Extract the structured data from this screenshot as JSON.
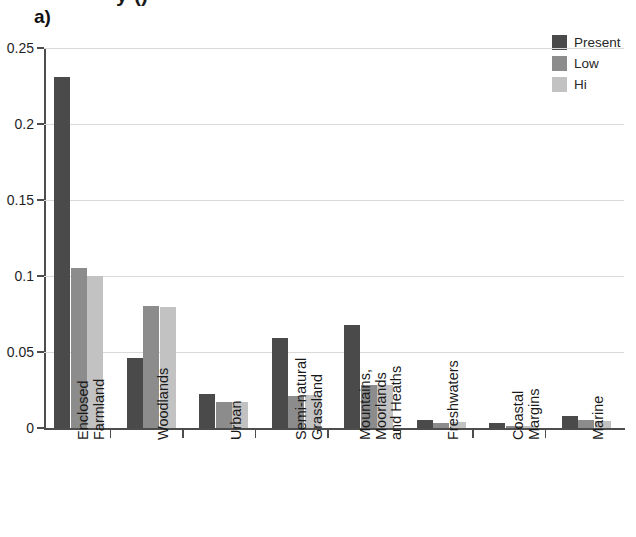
{
  "panel": {
    "label": "a)",
    "title_partial": "y ()"
  },
  "legend": {
    "position": "top-right",
    "entries": [
      {
        "label": "Present",
        "color": "#4a4a4a"
      },
      {
        "label": "Low",
        "color": "#8c8c8c"
      },
      {
        "label": "Hi",
        "color": "#c2c2c2"
      }
    ]
  },
  "axes": {
    "y_ticks": [
      "0",
      "0.05",
      "0.1",
      "0.15",
      "0.2",
      "0.25"
    ],
    "y_tick_values": [
      0,
      0.05,
      0.1,
      0.15,
      0.2,
      0.25
    ]
  },
  "chart_data": {
    "type": "bar",
    "title": "",
    "xlabel": "",
    "ylabel": "",
    "ylim": [
      0,
      0.25
    ],
    "grid": true,
    "legend_position": "top-right",
    "categories": [
      [
        "Enclosed",
        "Farmland"
      ],
      [
        "Woodlands"
      ],
      [
        "Urban"
      ],
      [
        "Semi-natural",
        "Grassland"
      ],
      [
        "Mountains,",
        "Moorlands",
        "and Heaths"
      ],
      [
        "Freshwaters"
      ],
      [
        "Coastal",
        "Margins"
      ],
      [
        "Marine"
      ]
    ],
    "category_labels": [
      "Enclosed Farmland",
      "Woodlands",
      "Urban",
      "Semi-natural Grassland",
      "Mountains, Moorlands and Heaths",
      "Freshwaters",
      "Coastal Margins",
      "Marine"
    ],
    "series": [
      {
        "name": "Present",
        "color": "#4a4a4a",
        "values": [
          0.231,
          0.046,
          0.0225,
          0.059,
          0.068,
          0.005,
          0.003,
          0.008
        ]
      },
      {
        "name": "Low",
        "color": "#8c8c8c",
        "values": [
          0.105,
          0.0805,
          0.017,
          0.021,
          0.028,
          0.0035,
          0.0012,
          0.005
        ]
      },
      {
        "name": "Hi",
        "color": "#c2c2c2",
        "values": [
          0.1,
          0.0795,
          0.017,
          0.0215,
          0.028,
          0.0042,
          0.0012,
          0.0045
        ]
      }
    ]
  }
}
